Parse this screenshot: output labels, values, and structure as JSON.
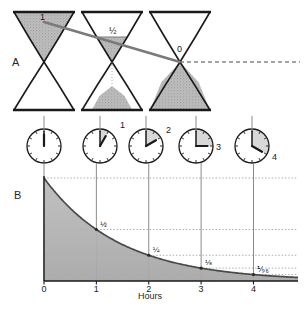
{
  "figure": {
    "panels": [
      {
        "id": "A",
        "label": "A",
        "x": 12,
        "y": 66
      },
      {
        "id": "B",
        "label": "B",
        "x": 14,
        "y": 199
      }
    ]
  },
  "hourglasses": {
    "level_labels": [
      "1",
      "½",
      "0"
    ],
    "items": [
      {
        "index": 0,
        "cx": 44,
        "top_fill": 1.0,
        "bottom_fill": 0.0,
        "level_label": "1",
        "label_x": 40,
        "label_y": 20
      },
      {
        "index": 1,
        "cx": 112,
        "top_fill": 0.5,
        "bottom_fill": 0.5,
        "level_label": "½",
        "label_x": 109,
        "label_y": 34
      },
      {
        "index": 2,
        "cx": 180,
        "top_fill": 0.0,
        "bottom_fill": 1.0,
        "level_label": "0",
        "label_x": 177,
        "label_y": 52
      }
    ],
    "top_y": 12,
    "waist_y": 62,
    "bottom_y": 110,
    "half_width": 30
  },
  "clocks": {
    "cy": 146,
    "radius": 17,
    "items": [
      {
        "index": 0,
        "cx": 44,
        "hours": 0,
        "label": "",
        "label_x": 0,
        "label_y": 0,
        "shaded": false
      },
      {
        "index": 1,
        "cx": 100,
        "hours": 1,
        "label": "1",
        "label_x": 120,
        "label_y": 128,
        "shaded": true
      },
      {
        "index": 2,
        "cx": 146,
        "hours": 2,
        "label": "2",
        "label_x": 166,
        "label_y": 133,
        "shaded": true
      },
      {
        "index": 3,
        "cx": 196,
        "hours": 3,
        "label": "3",
        "label_x": 216,
        "label_y": 150,
        "shaded": true
      },
      {
        "index": 4,
        "cx": 252,
        "hours": 4,
        "label": "4",
        "label_x": 272,
        "label_y": 160,
        "shaded": true
      }
    ]
  },
  "connectors": {
    "dashed_line": {
      "x1": 180,
      "y1": 62,
      "x2": 300,
      "y2": 62
    },
    "diagonal_line": {
      "x1": 44,
      "y1": 22,
      "x2": 180,
      "y2": 62
    },
    "drop_x_positions": [
      44,
      100,
      146,
      196,
      252
    ]
  },
  "chart_data": {
    "type": "line",
    "title": "",
    "subtitle": "",
    "xlabel": "Hours",
    "ylabel": "",
    "x": [
      0,
      1,
      2,
      3,
      4
    ],
    "values": [
      1,
      0.5,
      0.25,
      0.125,
      0.0625
    ],
    "point_labels": [
      "",
      "½",
      "¼",
      "⅛",
      "⅑₆"
    ],
    "point_label_text": [
      "",
      "1/2",
      "1/4",
      "1/8",
      "1/16"
    ],
    "xticks": [
      "0",
      "1",
      "2",
      "3",
      "4"
    ],
    "xlim": [
      0,
      4.85
    ],
    "ylim": [
      0,
      1
    ],
    "grid": true,
    "gridlines_y": [
      0.5,
      0.25,
      0.125,
      0.0625
    ],
    "series": [
      {
        "name": "remaining fraction",
        "values": [
          1,
          0.5,
          0.25,
          0.125,
          0.0625
        ]
      }
    ],
    "legend_position": "none",
    "curve_fill": true,
    "decay_law": "N = N0 * (1/2)^t"
  },
  "chart_layout": {
    "plot_left": 44,
    "plot_right": 298,
    "plot_top": 178,
    "plot_bottom": 281,
    "axis_label_y": 299,
    "axis_label_x": 150,
    "tick_label_y": 292
  },
  "colors": {
    "ink": "#1a1a1a",
    "sand": "#b9b9b9",
    "sand_dark": "#9e9e9e",
    "curve_fill": "#b5b5b5",
    "curve_stroke": "#4a4a4a",
    "grid": "#8c8c8c",
    "connector": "#8a8a8a",
    "diagonal": "#7a7a7a",
    "clock_shade": "#d8d8d8",
    "background": "#ffffff"
  }
}
